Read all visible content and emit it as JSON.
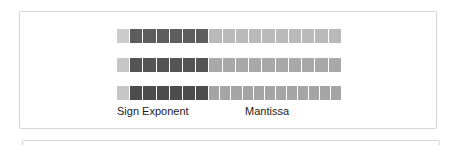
{
  "figure": {
    "labels": {
      "sign_exponent": "Sign Exponent",
      "mantissa": "Mantissa"
    },
    "colors": {
      "panel_border": "#d7d7d7",
      "background": "#ffffff",
      "label_text": "#1c1c1c"
    },
    "rows": [
      {
        "name": "format-row-1",
        "sign_bits": 1,
        "exponent_bits": 6,
        "mantissa_bits": 10,
        "sign_color": "#cbcbcb",
        "exponent_color": "#5d5d5d",
        "mantissa_color": "#b9b9b9"
      },
      {
        "name": "format-row-2",
        "sign_bits": 1,
        "exponent_bits": 6,
        "mantissa_bits": 10,
        "sign_color": "#c6c6c6",
        "exponent_color": "#545454",
        "mantissa_color": "#a8a8a8"
      },
      {
        "name": "format-row-3",
        "sign_bits": 1,
        "exponent_bits": 6,
        "mantissa_bits": 12,
        "sign_color": "#c6c6c6",
        "exponent_color": "#4c4c4c",
        "mantissa_color": "#a5a5a5"
      }
    ]
  }
}
